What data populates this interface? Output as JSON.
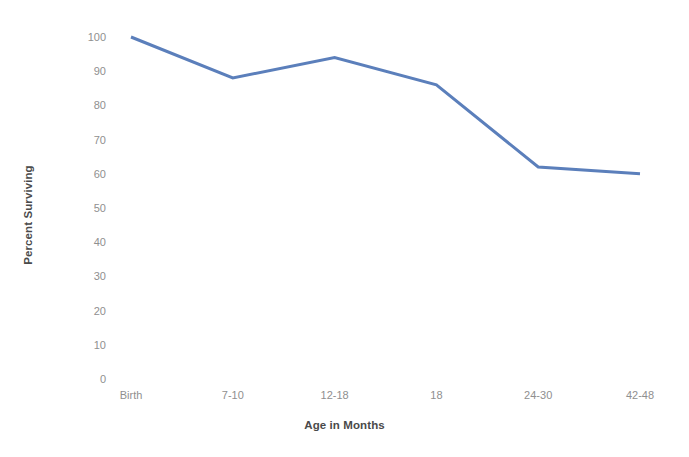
{
  "chart_data": {
    "type": "line",
    "title": "",
    "subtitle": "",
    "xlabel": "Age in Months",
    "ylabel": "Percent Surviving",
    "categories": [
      "Birth",
      "7-10",
      "12-18",
      "18",
      "24-30",
      "42-48"
    ],
    "values": [
      100,
      88,
      94,
      86,
      62,
      60
    ],
    "series": [
      {
        "name": "Percent Surviving",
        "values": [
          100,
          88,
          94,
          86,
          62,
          60
        ],
        "color": "#5B7FBB",
        "line_width": 3,
        "markers": false
      }
    ],
    "ylim": [
      0,
      100
    ],
    "y_ticks": [
      100,
      90,
      80,
      70,
      60,
      50,
      40,
      30,
      20,
      10,
      0
    ],
    "y_tick_labels": [
      "100",
      "90",
      "80",
      "70",
      "60",
      "50",
      "40",
      "30",
      "20",
      "10",
      "0"
    ],
    "x_tick_labels": [
      "Birth",
      "7-10",
      "12-18",
      "18",
      "24-30",
      "42-48"
    ],
    "grid": false,
    "axis_lines": false,
    "legend": false,
    "legend_position": "none",
    "annotations": [],
    "colors": {
      "line": "#5B7FBB",
      "tick_label": "#8f8f8f",
      "axis_title": "#4a4a4a",
      "background": "#ffffff"
    }
  }
}
